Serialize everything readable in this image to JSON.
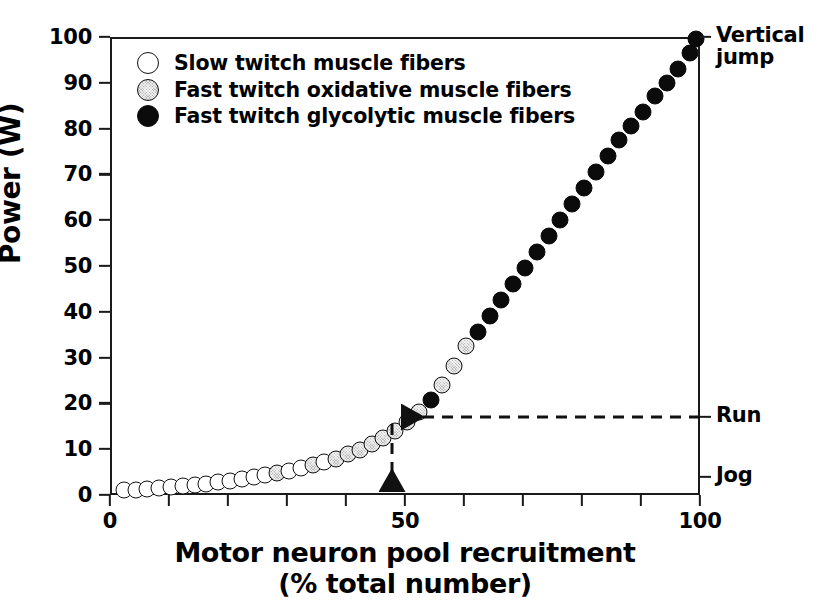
{
  "figure": {
    "y_axis_title": "Power (W)",
    "x_axis_title_line1": "Motor neuron pool recruitment",
    "x_axis_title_line2": "(% total number)"
  },
  "legend": {
    "items": [
      {
        "key": "slow",
        "label": "Slow twitch muscle fibers",
        "color": "#ffffff"
      },
      {
        "key": "oxid",
        "label": "Fast twitch oxidative muscle fibers",
        "color": "#b9b9b9"
      },
      {
        "key": "glyc",
        "label": "Fast twitch glycolytic muscle fibers",
        "color": "#0b0b0b"
      }
    ]
  },
  "right_labels": [
    {
      "name": "vertical-jump",
      "text": "Vertical",
      "text2": "jump",
      "value": 100
    },
    {
      "name": "run",
      "text": "Run",
      "value": 17
    },
    {
      "name": "jog",
      "text": "Jog",
      "value": 4
    }
  ],
  "annotation": {
    "run_power": 17,
    "run_recruitment": 47,
    "horizontal_arrow": "dashed-left-arrow",
    "vertical_arrow": "dashed-down-arrow"
  },
  "chart_data": {
    "type": "scatter",
    "title": "",
    "xlabel": "Motor neuron pool recruitment (% total number)",
    "ylabel": "Power (W)",
    "xlim": [
      0,
      100
    ],
    "ylim": [
      0,
      100
    ],
    "xticks": [
      0,
      10,
      20,
      30,
      40,
      50,
      60,
      70,
      80,
      90,
      100
    ],
    "xticklabels": [
      "0",
      "",
      "",
      "",
      "",
      "50",
      "",
      "",
      "",
      "",
      "100"
    ],
    "yticks": [
      0,
      10,
      20,
      30,
      40,
      50,
      60,
      70,
      80,
      90,
      100
    ],
    "yticklabels": [
      "0",
      "10",
      "20",
      "30",
      "40",
      "50",
      "60",
      "70",
      "80",
      "90",
      "100"
    ],
    "grid": false,
    "legend_position": "top-left",
    "series": [
      {
        "name": "Slow twitch muscle fibers",
        "color": "#ffffff",
        "x": [
          2,
          4,
          6,
          8,
          10,
          12,
          14,
          16,
          18,
          20,
          22,
          24,
          26,
          30,
          32,
          36
        ],
        "y": [
          1.5,
          1.6,
          1.8,
          2.0,
          2.2,
          2.4,
          2.6,
          2.9,
          3.2,
          3.5,
          3.9,
          4.3,
          4.7,
          5.7,
          6.3,
          7.6
        ]
      },
      {
        "name": "Fast twitch oxidative muscle fibers",
        "color": "#b9b9b9",
        "x": [
          28,
          34,
          38,
          40,
          42,
          44,
          46,
          48,
          50,
          52,
          56,
          58,
          60
        ],
        "y": [
          5.2,
          6.9,
          8.4,
          9.3,
          10.3,
          11.5,
          12.9,
          14.5,
          16.4,
          18.6,
          24.5,
          28.5,
          33.0
        ]
      },
      {
        "name": "Fast twitch glycolytic muscle fibers",
        "color": "#0b0b0b",
        "x": [
          54,
          62,
          64,
          66,
          68,
          70,
          72,
          74,
          76,
          78,
          80,
          82,
          84,
          86,
          88,
          90,
          92,
          94,
          96,
          98,
          99
        ],
        "y": [
          21.2,
          36.0,
          39.5,
          43.0,
          46.5,
          50.0,
          53.5,
          57.0,
          60.5,
          64.0,
          67.5,
          71.0,
          74.5,
          78.0,
          81.0,
          84.0,
          87.5,
          90.5,
          93.5,
          97.0,
          100.0
        ]
      }
    ],
    "points": [
      {
        "x": 2,
        "y": 1.5,
        "c": "slow"
      },
      {
        "x": 4,
        "y": 1.6,
        "c": "slow"
      },
      {
        "x": 6,
        "y": 1.8,
        "c": "slow"
      },
      {
        "x": 8,
        "y": 2.0,
        "c": "slow"
      },
      {
        "x": 10,
        "y": 2.2,
        "c": "slow"
      },
      {
        "x": 12,
        "y": 2.4,
        "c": "slow"
      },
      {
        "x": 14,
        "y": 2.6,
        "c": "slow"
      },
      {
        "x": 16,
        "y": 2.9,
        "c": "slow"
      },
      {
        "x": 18,
        "y": 3.2,
        "c": "slow"
      },
      {
        "x": 20,
        "y": 3.5,
        "c": "slow"
      },
      {
        "x": 22,
        "y": 3.9,
        "c": "slow"
      },
      {
        "x": 24,
        "y": 4.3,
        "c": "slow"
      },
      {
        "x": 26,
        "y": 4.7,
        "c": "slow"
      },
      {
        "x": 28,
        "y": 5.2,
        "c": "oxid"
      },
      {
        "x": 30,
        "y": 5.7,
        "c": "slow"
      },
      {
        "x": 32,
        "y": 6.3,
        "c": "slow"
      },
      {
        "x": 34,
        "y": 6.9,
        "c": "oxid"
      },
      {
        "x": 36,
        "y": 7.6,
        "c": "slow"
      },
      {
        "x": 38,
        "y": 8.4,
        "c": "oxid"
      },
      {
        "x": 40,
        "y": 9.3,
        "c": "oxid"
      },
      {
        "x": 42,
        "y": 10.3,
        "c": "oxid"
      },
      {
        "x": 44,
        "y": 11.5,
        "c": "oxid"
      },
      {
        "x": 46,
        "y": 12.9,
        "c": "oxid"
      },
      {
        "x": 48,
        "y": 14.5,
        "c": "oxid"
      },
      {
        "x": 50,
        "y": 16.4,
        "c": "oxid"
      },
      {
        "x": 52,
        "y": 18.6,
        "c": "oxid"
      },
      {
        "x": 54,
        "y": 21.2,
        "c": "glyc"
      },
      {
        "x": 56,
        "y": 24.5,
        "c": "oxid"
      },
      {
        "x": 58,
        "y": 28.5,
        "c": "oxid"
      },
      {
        "x": 60,
        "y": 33.0,
        "c": "oxid"
      },
      {
        "x": 62,
        "y": 36.0,
        "c": "glyc"
      },
      {
        "x": 64,
        "y": 39.5,
        "c": "glyc"
      },
      {
        "x": 66,
        "y": 43.0,
        "c": "glyc"
      },
      {
        "x": 68,
        "y": 46.5,
        "c": "glyc"
      },
      {
        "x": 70,
        "y": 50.0,
        "c": "glyc"
      },
      {
        "x": 72,
        "y": 53.5,
        "c": "glyc"
      },
      {
        "x": 74,
        "y": 57.0,
        "c": "glyc"
      },
      {
        "x": 76,
        "y": 60.5,
        "c": "glyc"
      },
      {
        "x": 78,
        "y": 64.0,
        "c": "glyc"
      },
      {
        "x": 80,
        "y": 67.5,
        "c": "glyc"
      },
      {
        "x": 82,
        "y": 71.0,
        "c": "glyc"
      },
      {
        "x": 84,
        "y": 74.5,
        "c": "glyc"
      },
      {
        "x": 86,
        "y": 78.0,
        "c": "glyc"
      },
      {
        "x": 88,
        "y": 81.0,
        "c": "glyc"
      },
      {
        "x": 90,
        "y": 84.0,
        "c": "glyc"
      },
      {
        "x": 92,
        "y": 87.5,
        "c": "glyc"
      },
      {
        "x": 94,
        "y": 90.5,
        "c": "glyc"
      },
      {
        "x": 96,
        "y": 93.5,
        "c": "glyc"
      },
      {
        "x": 98,
        "y": 97.0,
        "c": "glyc"
      },
      {
        "x": 99,
        "y": 100.0,
        "c": "glyc"
      }
    ]
  }
}
